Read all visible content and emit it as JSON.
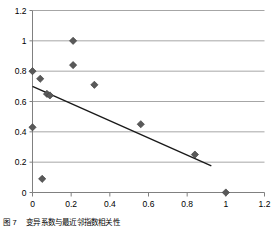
{
  "figure": {
    "caption_label": "图 7",
    "caption_text": "变异系数与最近邻指数相关性"
  },
  "colors": {
    "marker": "#595959",
    "marker_edge": "#404040",
    "trendline": "#1a1a1a",
    "gridline": "#a6a6a6",
    "axis": "#808080",
    "background": "#ffffff",
    "text": "#000000"
  },
  "chart_data": {
    "type": "scatter",
    "title": "",
    "xlabel": "",
    "ylabel": "",
    "xlim": [
      0,
      1.2
    ],
    "ylim": [
      0,
      1.2
    ],
    "xticks": [
      0,
      0.2,
      0.4,
      0.6,
      0.8,
      1,
      1.2
    ],
    "yticks": [
      0,
      0.2,
      0.4,
      0.6,
      0.8,
      1,
      1.2
    ],
    "xtick_labels": [
      "0",
      "0.2",
      "0.4",
      "0.6",
      "0.8",
      "1",
      "1.2"
    ],
    "ytick_labels": [
      "0",
      "0.2",
      "0.4",
      "0.6",
      "0.8",
      "1",
      "1.2"
    ],
    "grid": "horizontal",
    "legend": "none",
    "marker": "diamond",
    "series": [
      {
        "name": "observations",
        "points": [
          [
            0.0,
            0.8
          ],
          [
            0.0,
            0.43
          ],
          [
            0.04,
            0.75
          ],
          [
            0.05,
            0.09
          ],
          [
            0.075,
            0.65
          ],
          [
            0.09,
            0.64
          ],
          [
            0.21,
            1.0
          ],
          [
            0.21,
            0.84
          ],
          [
            0.32,
            0.71
          ],
          [
            0.56,
            0.45
          ],
          [
            0.84,
            0.25
          ],
          [
            1.0,
            0.0
          ]
        ]
      }
    ],
    "trendline": {
      "name": "linear fit",
      "x_start": 0.0,
      "y_start": 0.7,
      "x_end": 0.925,
      "y_end": 0.175
    }
  }
}
